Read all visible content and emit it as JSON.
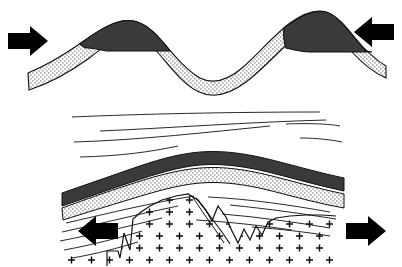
{
  "figure": {
    "background_color": "#ffffff",
    "width": 402,
    "height": 267,
    "panel_count": 2
  },
  "palette": {
    "line": "#111111",
    "dark_unit": "#3a3a3a",
    "dark_unit_edge": "#111111",
    "stipple_dot": "#444444",
    "stipple_bg": "#ffffff",
    "arrow_fill": "#000000",
    "intrusion_symbol": "#111111",
    "page_background": "#ffffff"
  },
  "panels": [
    {
      "id": "upper-panel",
      "name": "compression-fold-panel",
      "caption": "",
      "stress_regime": "compression",
      "fold_form": "sinusoidal anticline-syncline-anticline",
      "arrows": [
        {
          "id": "arrow-left-compression",
          "name": "compression-arrow-left",
          "direction": "right",
          "meaning": "compression inward",
          "x": 8,
          "y": 42
        },
        {
          "id": "arrow-right-compression",
          "name": "compression-arrow-right",
          "direction": "left",
          "meaning": "compression inward",
          "x": 394,
          "y": 34
        }
      ],
      "units": [
        {
          "id": "upper-dark-unit",
          "name": "dark-caprock-unit",
          "fill": "dark",
          "description": "dark lens at fold crests"
        },
        {
          "id": "upper-stipple-unit",
          "name": "stippled-sandstone-unit",
          "fill": "stipple",
          "description": "stippled sandstone band following fold"
        }
      ]
    },
    {
      "id": "lower-panel",
      "name": "extension-intrusion-panel",
      "caption": "",
      "stress_regime": "extension",
      "fold_form": "broad anticline with cored pluton",
      "arrows": [
        {
          "id": "arrow-left-extension",
          "name": "extension-arrow-left",
          "direction": "left",
          "meaning": "extension outward",
          "x": 38,
          "y": 232
        },
        {
          "id": "arrow-right-extension",
          "name": "extension-arrow-right",
          "direction": "right",
          "meaning": "extension outward",
          "x": 362,
          "y": 232
        }
      ],
      "units": [
        {
          "id": "lower-dark-unit",
          "name": "dark-caprock-unit",
          "fill": "dark",
          "description": "dark arched band over anticline"
        },
        {
          "id": "lower-stipple-unit",
          "name": "stippled-sandstone-unit",
          "fill": "stipple",
          "description": "stippled band beneath dark unit"
        },
        {
          "id": "pluton",
          "name": "granite-pluton",
          "fill": "plus-symbols",
          "description": "igneous intrusion shown with cross/plus ornament"
        }
      ],
      "bedding_line_count": 16,
      "pluton_symbol": "+"
    }
  ]
}
